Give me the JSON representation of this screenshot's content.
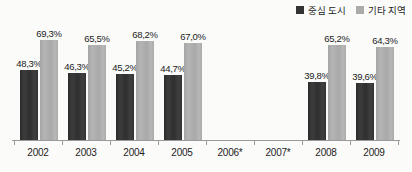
{
  "chart_data": {
    "type": "bar",
    "title": "",
    "subtitle": "",
    "xlabel": "",
    "ylabel": "",
    "ylim": [
      0,
      80
    ],
    "grid": false,
    "legend_position": "top-right",
    "categories": [
      "2002",
      "2003",
      "2004",
      "2005",
      "2006*",
      "2007*",
      "2008",
      "2009"
    ],
    "series": [
      {
        "name": "중심 도시",
        "color": "#333333",
        "values": [
          48.3,
          46.3,
          45.2,
          44.7,
          null,
          null,
          39.8,
          39.6
        ],
        "labels": [
          "48,3%",
          "46,3%",
          "45,2%",
          "44,7%",
          "",
          "",
          "39,8%",
          "39,6%"
        ]
      },
      {
        "name": "기타 지역",
        "color": "#ababab",
        "values": [
          69.3,
          65.5,
          68.2,
          67.0,
          null,
          null,
          65.2,
          64.3
        ],
        "labels": [
          "69,3%",
          "65,5%",
          "68,2%",
          "67,0%",
          "",
          "",
          "65,2%",
          "64,3%"
        ]
      }
    ]
  },
  "legend": {
    "items": [
      {
        "label": "중심 도시",
        "swatch": "series-dark"
      },
      {
        "label": "기타 지역",
        "swatch": "series-light"
      }
    ]
  },
  "colors": {
    "series_dark": "#333333",
    "series_light": "#ababab",
    "axis": "#9a9a9a",
    "text": "#1c1c1c",
    "background": "#fbfbfa"
  }
}
